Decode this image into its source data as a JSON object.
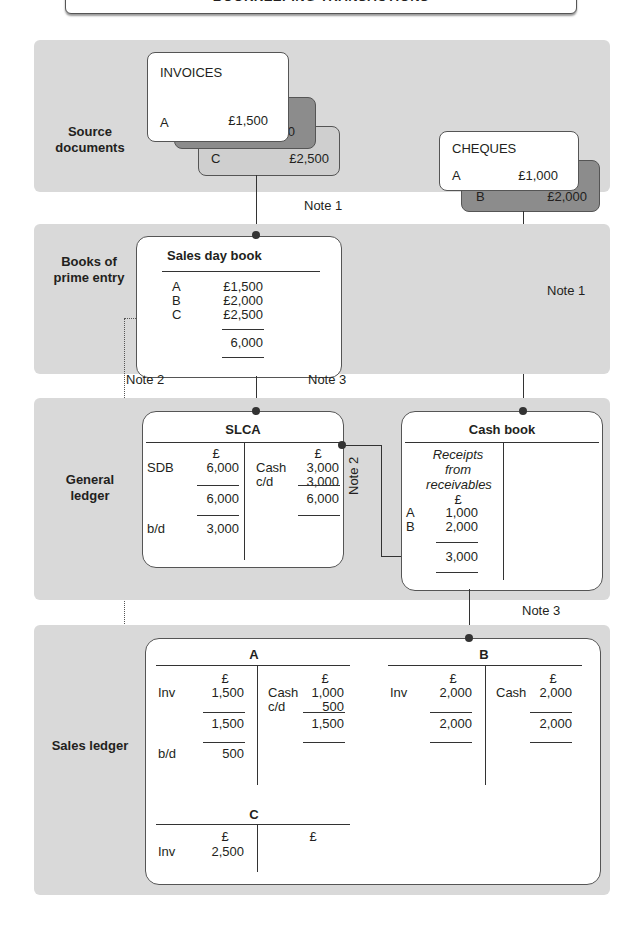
{
  "title": "BOOKKEEPING TRANSACTIONS",
  "bands": {
    "source": "Source documents",
    "prime": "Books of prime entry",
    "general": "General ledger",
    "sales": "Sales ledger"
  },
  "invoices": {
    "label": "INVOICES",
    "items": [
      {
        "id": "A",
        "amount": "£1,500"
      },
      {
        "id": "B",
        "amount": "£2,000"
      },
      {
        "id": "C",
        "amount": "£2,500"
      }
    ]
  },
  "cheques": {
    "label": "CHEQUES",
    "items": [
      {
        "id": "A",
        "amount": "£1,000"
      },
      {
        "id": "B",
        "amount": "£2,000"
      }
    ]
  },
  "notes": {
    "note1": "Note 1",
    "note2": "Note 2",
    "note3": "Note 3"
  },
  "sales_day_book": {
    "title": "Sales day book",
    "rows": [
      {
        "id": "A",
        "amount": "£1,500"
      },
      {
        "id": "B",
        "amount": "£2,000"
      },
      {
        "id": "C",
        "amount": "£2,500"
      }
    ],
    "total": "6,000"
  },
  "slca": {
    "title": "SLCA",
    "currency": "£",
    "debit": [
      {
        "label": "SDB",
        "amount": "6,000"
      }
    ],
    "credit": [
      {
        "label": "Cash",
        "amount": "3,000"
      },
      {
        "label": "c/d",
        "amount": "3,000"
      }
    ],
    "debit_total": "6,000",
    "credit_total": "6,000",
    "bd_label": "b/d",
    "bd_amount": "3,000"
  },
  "cash_book": {
    "title": "Cash book",
    "column_heading": [
      "Receipts",
      "from",
      "receivables"
    ],
    "currency": "£",
    "rows": [
      {
        "id": "A",
        "amount": "1,000"
      },
      {
        "id": "B",
        "amount": "2,000"
      }
    ],
    "total": "3,000"
  },
  "sales_ledger": {
    "A": {
      "title": "A",
      "currency": "£",
      "debit": [
        {
          "label": "Inv",
          "amount": "1,500"
        }
      ],
      "credit": [
        {
          "label": "Cash",
          "amount": "1,000"
        },
        {
          "label": "c/d",
          "amount": "500"
        }
      ],
      "debit_total": "1,500",
      "credit_total": "1,500",
      "bd_label": "b/d",
      "bd_amount": "500"
    },
    "B": {
      "title": "B",
      "currency": "£",
      "debit": [
        {
          "label": "Inv",
          "amount": "2,000"
        }
      ],
      "credit": [
        {
          "label": "Cash",
          "amount": "2,000"
        }
      ],
      "debit_total": "2,000",
      "credit_total": "2,000"
    },
    "C": {
      "title": "C",
      "currency": "£",
      "debit": [
        {
          "label": "Inv",
          "amount": "2,500"
        }
      ]
    }
  }
}
